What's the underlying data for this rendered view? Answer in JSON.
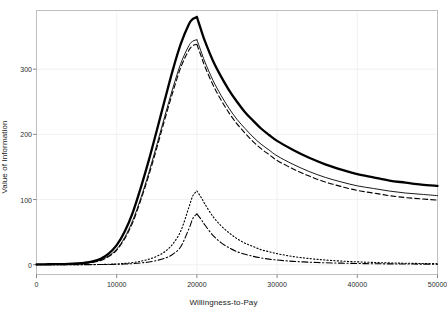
{
  "chart_data": {
    "type": "line",
    "title": "",
    "subtitle": "",
    "xlabel": "Willingness-to-Pay",
    "ylabel": "Value of Information",
    "xlim": [
      0,
      50000
    ],
    "ylim": [
      -15,
      390
    ],
    "xticks": [
      0,
      10000,
      20000,
      30000,
      40000,
      50000
    ],
    "xtick_labels": [
      "0",
      "10000",
      "20000",
      "30000",
      "40000",
      "50000"
    ],
    "yticks": [
      0,
      100,
      200,
      300
    ],
    "ytick_labels": [
      "0",
      "100",
      "200",
      "300"
    ],
    "grid": true,
    "grid_color": "#eeeeee",
    "panel_background": "#ffffff",
    "panel_border_color": "#bfbfbf",
    "legend": "none",
    "legend_position": "none",
    "line_color": "#000000",
    "x": [
      0,
      1000,
      2000,
      3000,
      4000,
      5000,
      6000,
      7000,
      8000,
      9000,
      10000,
      11000,
      12000,
      13000,
      14000,
      15000,
      16000,
      17000,
      18000,
      19000,
      19500,
      20000,
      20500,
      21000,
      22000,
      23000,
      24000,
      25000,
      26000,
      27000,
      28000,
      29000,
      30000,
      32000,
      34000,
      36000,
      38000,
      40000,
      42000,
      44000,
      46000,
      48000,
      50000
    ],
    "series": [
      {
        "name": "evpi-total",
        "style": "solid-thick",
        "linewidth": 2.3,
        "dash": "none",
        "values": [
          0.5,
          0.6,
          0.8,
          1.0,
          1.4,
          2.0,
          3.0,
          5.0,
          9.0,
          17.0,
          30.0,
          51.0,
          80.0,
          118.0,
          160.0,
          206.0,
          253.0,
          299.0,
          339.0,
          369.0,
          377.0,
          380.0,
          361.0,
          343.0,
          313.0,
          289.0,
          268.0,
          250.0,
          234.0,
          221.0,
          209.0,
          199.0,
          190.0,
          176.0,
          164.0,
          154.0,
          146.0,
          139.0,
          134.0,
          129.0,
          126.0,
          123.0,
          121.0
        ]
      },
      {
        "name": "evppi-thin-solid",
        "style": "solid-thin",
        "linewidth": 0.9,
        "dash": "none",
        "values": [
          0.4,
          0.5,
          0.6,
          0.8,
          1.1,
          1.6,
          2.4,
          4.0,
          7.0,
          13.5,
          24.0,
          42.0,
          68.0,
          102.0,
          141.0,
          184.0,
          228.0,
          271.0,
          309.0,
          336.0,
          343.0,
          345.0,
          328.0,
          311.0,
          283.0,
          260.0,
          240.0,
          223.0,
          209.0,
          196.0,
          185.0,
          176.0,
          167.0,
          154.0,
          143.0,
          134.0,
          127.0,
          121.0,
          117.0,
          113.0,
          110.0,
          108.0,
          106.0
        ]
      },
      {
        "name": "evppi-dashed",
        "style": "dashed",
        "linewidth": 1.1,
        "dash": "5,3",
        "values": [
          0.3,
          0.4,
          0.5,
          0.7,
          1.0,
          1.4,
          2.2,
          3.6,
          6.4,
          12.5,
          22.5,
          40.0,
          65.0,
          99.0,
          137.0,
          179.0,
          223.0,
          265.0,
          303.0,
          329.0,
          336.0,
          338.0,
          321.0,
          304.0,
          276.0,
          253.0,
          233.0,
          216.0,
          202.0,
          189.0,
          178.0,
          169.0,
          160.0,
          147.0,
          136.0,
          127.0,
          120.0,
          114.0,
          110.0,
          106.0,
          103.0,
          101.0,
          99.0
        ]
      },
      {
        "name": "evppi-dotted",
        "style": "dotted",
        "linewidth": 1.1,
        "dash": "1.2,2.2",
        "values": [
          0.1,
          0.1,
          0.1,
          0.1,
          0.1,
          0.2,
          0.2,
          0.3,
          0.4,
          0.7,
          1.2,
          2.0,
          3.3,
          5.3,
          8.4,
          13.0,
          20.0,
          32.0,
          52.0,
          88.0,
          106.0,
          113.0,
          104.0,
          93.0,
          74.0,
          60.0,
          49.0,
          40.0,
          33.0,
          28.0,
          23.0,
          20.0,
          17.0,
          12.5,
          9.5,
          7.2,
          5.6,
          4.4,
          3.5,
          2.8,
          2.3,
          1.9,
          1.6
        ]
      },
      {
        "name": "evppi-dashdot",
        "style": "dash-dot",
        "linewidth": 1.1,
        "dash": "6,2.5,1.2,2.5",
        "values": [
          0.1,
          0.1,
          0.1,
          0.1,
          0.1,
          0.1,
          0.2,
          0.2,
          0.3,
          0.4,
          0.7,
          1.1,
          1.7,
          2.7,
          4.2,
          6.5,
          10.0,
          16.0,
          28.0,
          55.0,
          71.0,
          78.0,
          70.0,
          61.0,
          45.0,
          34.0,
          26.0,
          20.0,
          16.0,
          13.0,
          10.5,
          8.6,
          7.2,
          5.2,
          3.9,
          3.0,
          2.4,
          1.9,
          1.5,
          1.3,
          1.1,
          0.9,
          0.8
        ]
      }
    ]
  },
  "axis": {
    "x_title": "Willingness-to-Pay",
    "y_title": "Value of Information"
  }
}
